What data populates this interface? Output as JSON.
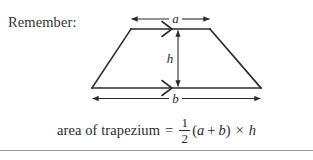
{
  "caption": {
    "remember_label": "Remember:"
  },
  "figure": {
    "shape_name": "trapezium",
    "labels": {
      "top_side": "a",
      "height": "h",
      "bottom_side": "b"
    },
    "parallel_marks": {
      "top_glyph": ">",
      "bottom_glyph": ">"
    },
    "stroke_color": "#2b2b2b",
    "arrow_color": "#2b2b2b"
  },
  "formula": {
    "words": "area of trapezium",
    "equals": "=",
    "fraction_numerator": "1",
    "fraction_denominator": "2",
    "open_paren": "(",
    "var_a": "a",
    "plus": "+",
    "var_b": "b",
    "close_paren": ")",
    "times": "×",
    "var_h": "h"
  },
  "rule": {
    "color": "#9a9a9a"
  }
}
